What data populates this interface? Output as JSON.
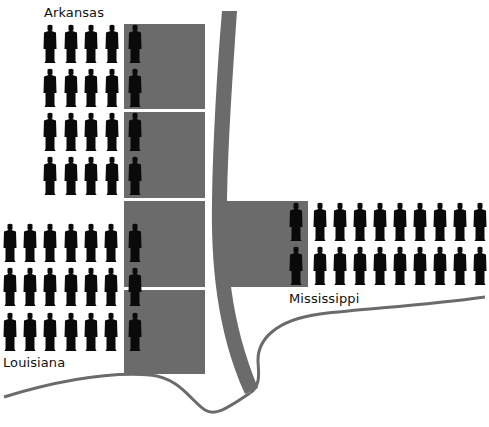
{
  "colors": {
    "background": "#ffffff",
    "block": "#6b6b6b",
    "river": "#6b6b6b",
    "figure": "#0a0a0a"
  },
  "labels": {
    "arkansas": "Arkansas",
    "louisiana": "Louisiana",
    "mississippi": "Mississippi"
  },
  "regions": [
    {
      "name": "Arkansas",
      "rows": 4,
      "per_row": 5,
      "columns_x": [
        50,
        71,
        91,
        112,
        135
      ],
      "rows_y": [
        25,
        69,
        113,
        157
      ]
    },
    {
      "name": "Louisiana",
      "rows": 3,
      "per_row": 7,
      "columns_x": [
        10,
        30,
        50,
        71,
        91,
        111,
        135
      ],
      "rows_y": [
        224,
        268,
        313
      ]
    },
    {
      "name": "Mississippi",
      "rows": 2,
      "per_row": 10,
      "columns_x": [
        296,
        320,
        340,
        360,
        380,
        400,
        420,
        440,
        460,
        480
      ],
      "rows_y": [
        203,
        247
      ]
    }
  ],
  "blocks": [
    {
      "region": "Arkansas",
      "x": 124,
      "y": 24,
      "w": 81,
      "h": 85
    },
    {
      "region": "Arkansas",
      "x": 124,
      "y": 112,
      "w": 81,
      "h": 86
    },
    {
      "region": "Louisiana",
      "x": 124,
      "y": 201,
      "w": 81,
      "h": 86
    },
    {
      "region": "Louisiana",
      "x": 124,
      "y": 290,
      "w": 81,
      "h": 84
    },
    {
      "region": "Mississippi",
      "x": 226,
      "y": 201,
      "w": 82,
      "h": 86
    }
  ],
  "figure_counts": {
    "Arkansas": 20,
    "Louisiana": 21,
    "Mississippi": 20
  }
}
